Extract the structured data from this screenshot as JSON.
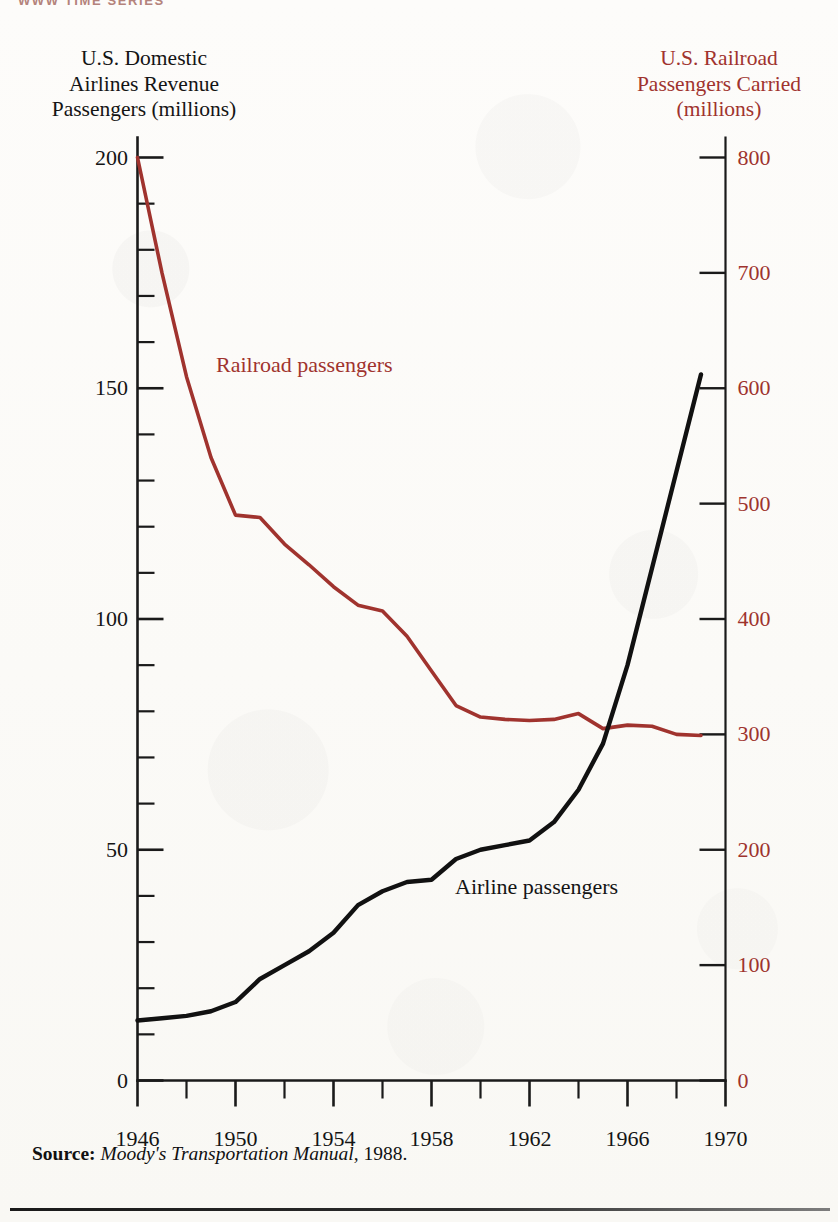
{
  "running_head": "WWW TIME SERIES",
  "left_axis_title": [
    "U.S. Domestic",
    "Airlines Revenue",
    "Passengers (millions)"
  ],
  "right_axis_title": [
    "U.S. Railroad",
    "Passengers Carried",
    "(millions)"
  ],
  "source": {
    "word": "Source:",
    "title": "Moody's Transportation Manual",
    "year": ", 1988."
  },
  "colors": {
    "railroad": "#a0332e",
    "airline": "#111111",
    "axis": "#1a1a1a",
    "paper": "#fdfcfa"
  },
  "chart_data": {
    "type": "line",
    "title": "",
    "xlabel": "",
    "grid": false,
    "legend_position": "inline-annotations",
    "x": [
      1946,
      1947,
      1948,
      1949,
      1950,
      1951,
      1952,
      1953,
      1954,
      1955,
      1956,
      1957,
      1958,
      1959,
      1960,
      1961,
      1962,
      1963,
      1964,
      1965,
      1966,
      1967,
      1968,
      1969
    ],
    "xlim": [
      1946,
      1970
    ],
    "x_major_ticks": [
      1946,
      1950,
      1954,
      1958,
      1962,
      1966,
      1970
    ],
    "x_minor_ticks": [
      1948,
      1952,
      1956,
      1960,
      1964,
      1968
    ],
    "x_tick_labels": [
      "1946",
      "1950",
      "1954",
      "1958",
      "1962",
      "1966",
      "1970"
    ],
    "axes": [
      {
        "side": "left",
        "label": "U.S. Domestic Airlines Revenue Passengers (millions)",
        "color": "#111111",
        "ylim": [
          0,
          200
        ],
        "major_ticks": [
          0,
          50,
          100,
          150,
          200
        ],
        "major_tick_labels": [
          "0",
          "50",
          "100",
          "150",
          "200"
        ],
        "minor_tick_step": 10
      },
      {
        "side": "right",
        "label": "U.S. Railroad Passengers Carried (millions)",
        "color": "#a0332e",
        "ylim": [
          0,
          800
        ],
        "major_ticks": [
          0,
          100,
          200,
          300,
          400,
          500,
          600,
          700,
          800
        ],
        "major_tick_labels": [
          "0",
          "100",
          "200",
          "300",
          "400",
          "500",
          "600",
          "700",
          "800"
        ],
        "minor_tick_step": 0
      }
    ],
    "series": [
      {
        "name": "Railroad passengers",
        "axis": "right",
        "color": "#a0332e",
        "annotation": "Railroad passengers",
        "values": [
          800,
          700,
          610,
          540,
          490,
          488,
          465,
          447,
          428,
          412,
          407,
          385,
          355,
          325,
          315,
          313,
          312,
          313,
          318,
          305,
          308,
          307,
          300,
          299
        ]
      },
      {
        "name": "Airline passengers",
        "axis": "left",
        "color": "#111111",
        "annotation": "Airline passengers",
        "values": [
          13,
          13.5,
          14,
          15,
          17,
          22,
          25,
          28,
          32,
          38,
          41,
          43,
          43.5,
          48,
          50,
          51,
          52,
          56,
          63,
          73,
          90,
          111,
          132,
          153
        ]
      }
    ]
  }
}
